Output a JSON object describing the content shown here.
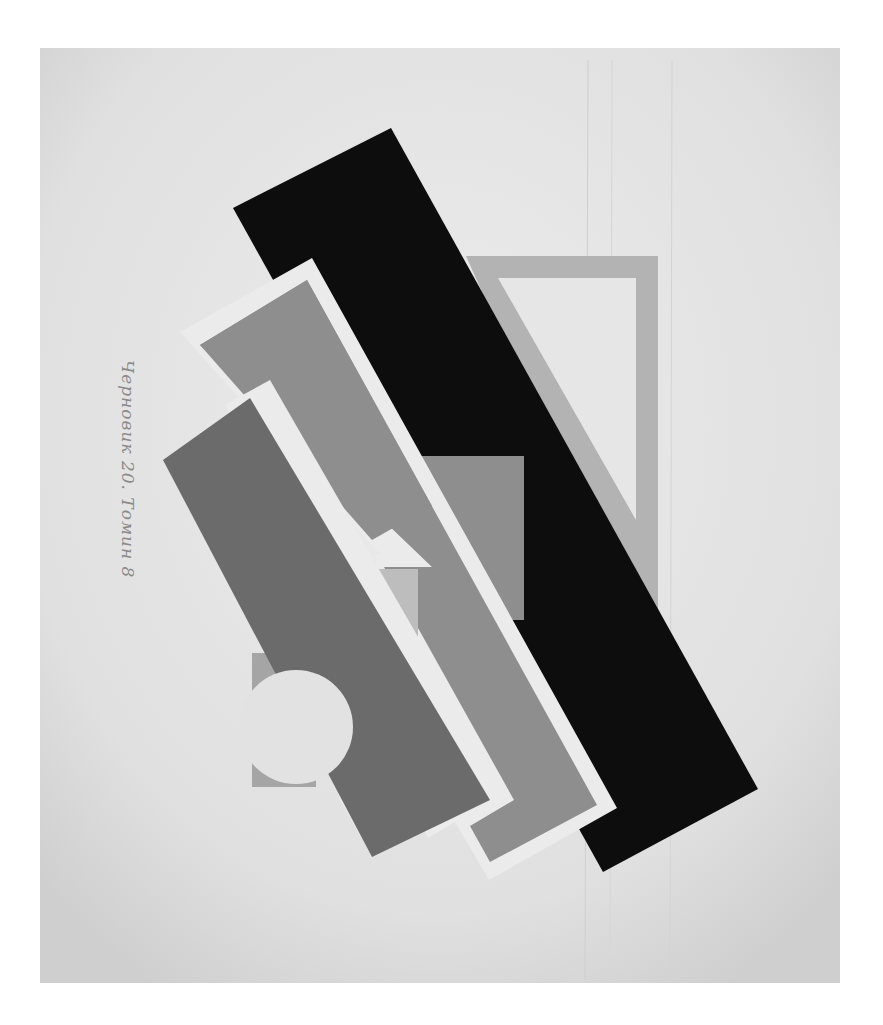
{
  "artwork": {
    "kind": "abstract geometric painting (photograph, grayscale)",
    "inscription": "Черновик 20. Томин 8",
    "palette": {
      "paper": "#e4e4e4",
      "paper_edge": "#d2d2d2",
      "black": "#0d0d0d",
      "dark_gray": "#6b6b6b",
      "medium_gray": "#8e8e8e",
      "light_gray": "#bdbdbd",
      "frame_gray": "#b3b3b3",
      "off_white": "#e2e2e2",
      "white_band": "#ebebeb"
    },
    "shapes": [
      "black-diagonal-bar",
      "gray-frame",
      "light-triangle",
      "center-gray-square",
      "white-band",
      "medium-gray-bar",
      "dark-gray-bar",
      "small-gray-square",
      "light-circle"
    ]
  }
}
